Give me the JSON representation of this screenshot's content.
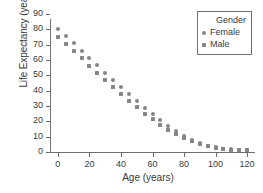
{
  "chart_data": {
    "type": "scatter",
    "title": "",
    "xlabel": "Age (years)",
    "ylabel": "Life Expectancy (years)",
    "xlim": [
      -5,
      125
    ],
    "ylim": [
      0,
      90
    ],
    "xticks": [
      0,
      20,
      40,
      60,
      80,
      100,
      120
    ],
    "yticks": [
      0,
      10,
      20,
      30,
      40,
      50,
      60,
      70,
      80,
      90
    ],
    "grid": false,
    "legend": {
      "title": "Gender",
      "position": "top-right",
      "entries": [
        {
          "name": "Female",
          "marker": "circle",
          "color": "#868686"
        },
        {
          "name": "Male",
          "marker": "square",
          "color": "#868686"
        }
      ]
    },
    "x": [
      0,
      5,
      10,
      15,
      20,
      25,
      30,
      35,
      40,
      45,
      50,
      55,
      60,
      65,
      70,
      75,
      80,
      85,
      90,
      95,
      100,
      105,
      110,
      115,
      120
    ],
    "series": [
      {
        "name": "Female",
        "marker": "circle",
        "color": "#868686",
        "values": [
          80.2,
          75.8,
          71.0,
          66.1,
          61.3,
          56.5,
          51.7,
          47.0,
          42.3,
          37.7,
          33.2,
          28.8,
          24.6,
          20.6,
          16.9,
          13.5,
          10.5,
          7.9,
          5.8,
          4.2,
          3.0,
          2.2,
          1.8,
          1.5,
          1.3
        ]
      },
      {
        "name": "Male",
        "marker": "square",
        "color": "#868686",
        "values": [
          75.1,
          70.6,
          65.8,
          61.0,
          56.2,
          51.5,
          46.8,
          42.2,
          37.7,
          33.3,
          29.1,
          25.1,
          21.3,
          17.8,
          14.6,
          11.7,
          9.2,
          7.0,
          5.2,
          3.8,
          2.7,
          2.0,
          1.6,
          1.4,
          1.2
        ]
      }
    ]
  }
}
